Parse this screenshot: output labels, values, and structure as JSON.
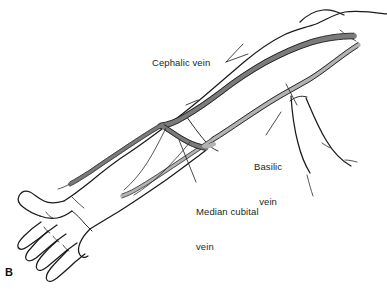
{
  "figure": {
    "panel_letter": "B",
    "background_color": "#ffffff"
  },
  "labels": {
    "cephalic": "Cephalic vein",
    "basilic_line1": "Basilic",
    "basilic_line2": "vein",
    "median_line1": "Median cubital",
    "median_line2": "vein"
  },
  "colors": {
    "cephalic_vein": "#7b7b7b",
    "basilic_vein": "#b3b3b3",
    "outline": "#1a1a1a",
    "text": "#231f20"
  }
}
